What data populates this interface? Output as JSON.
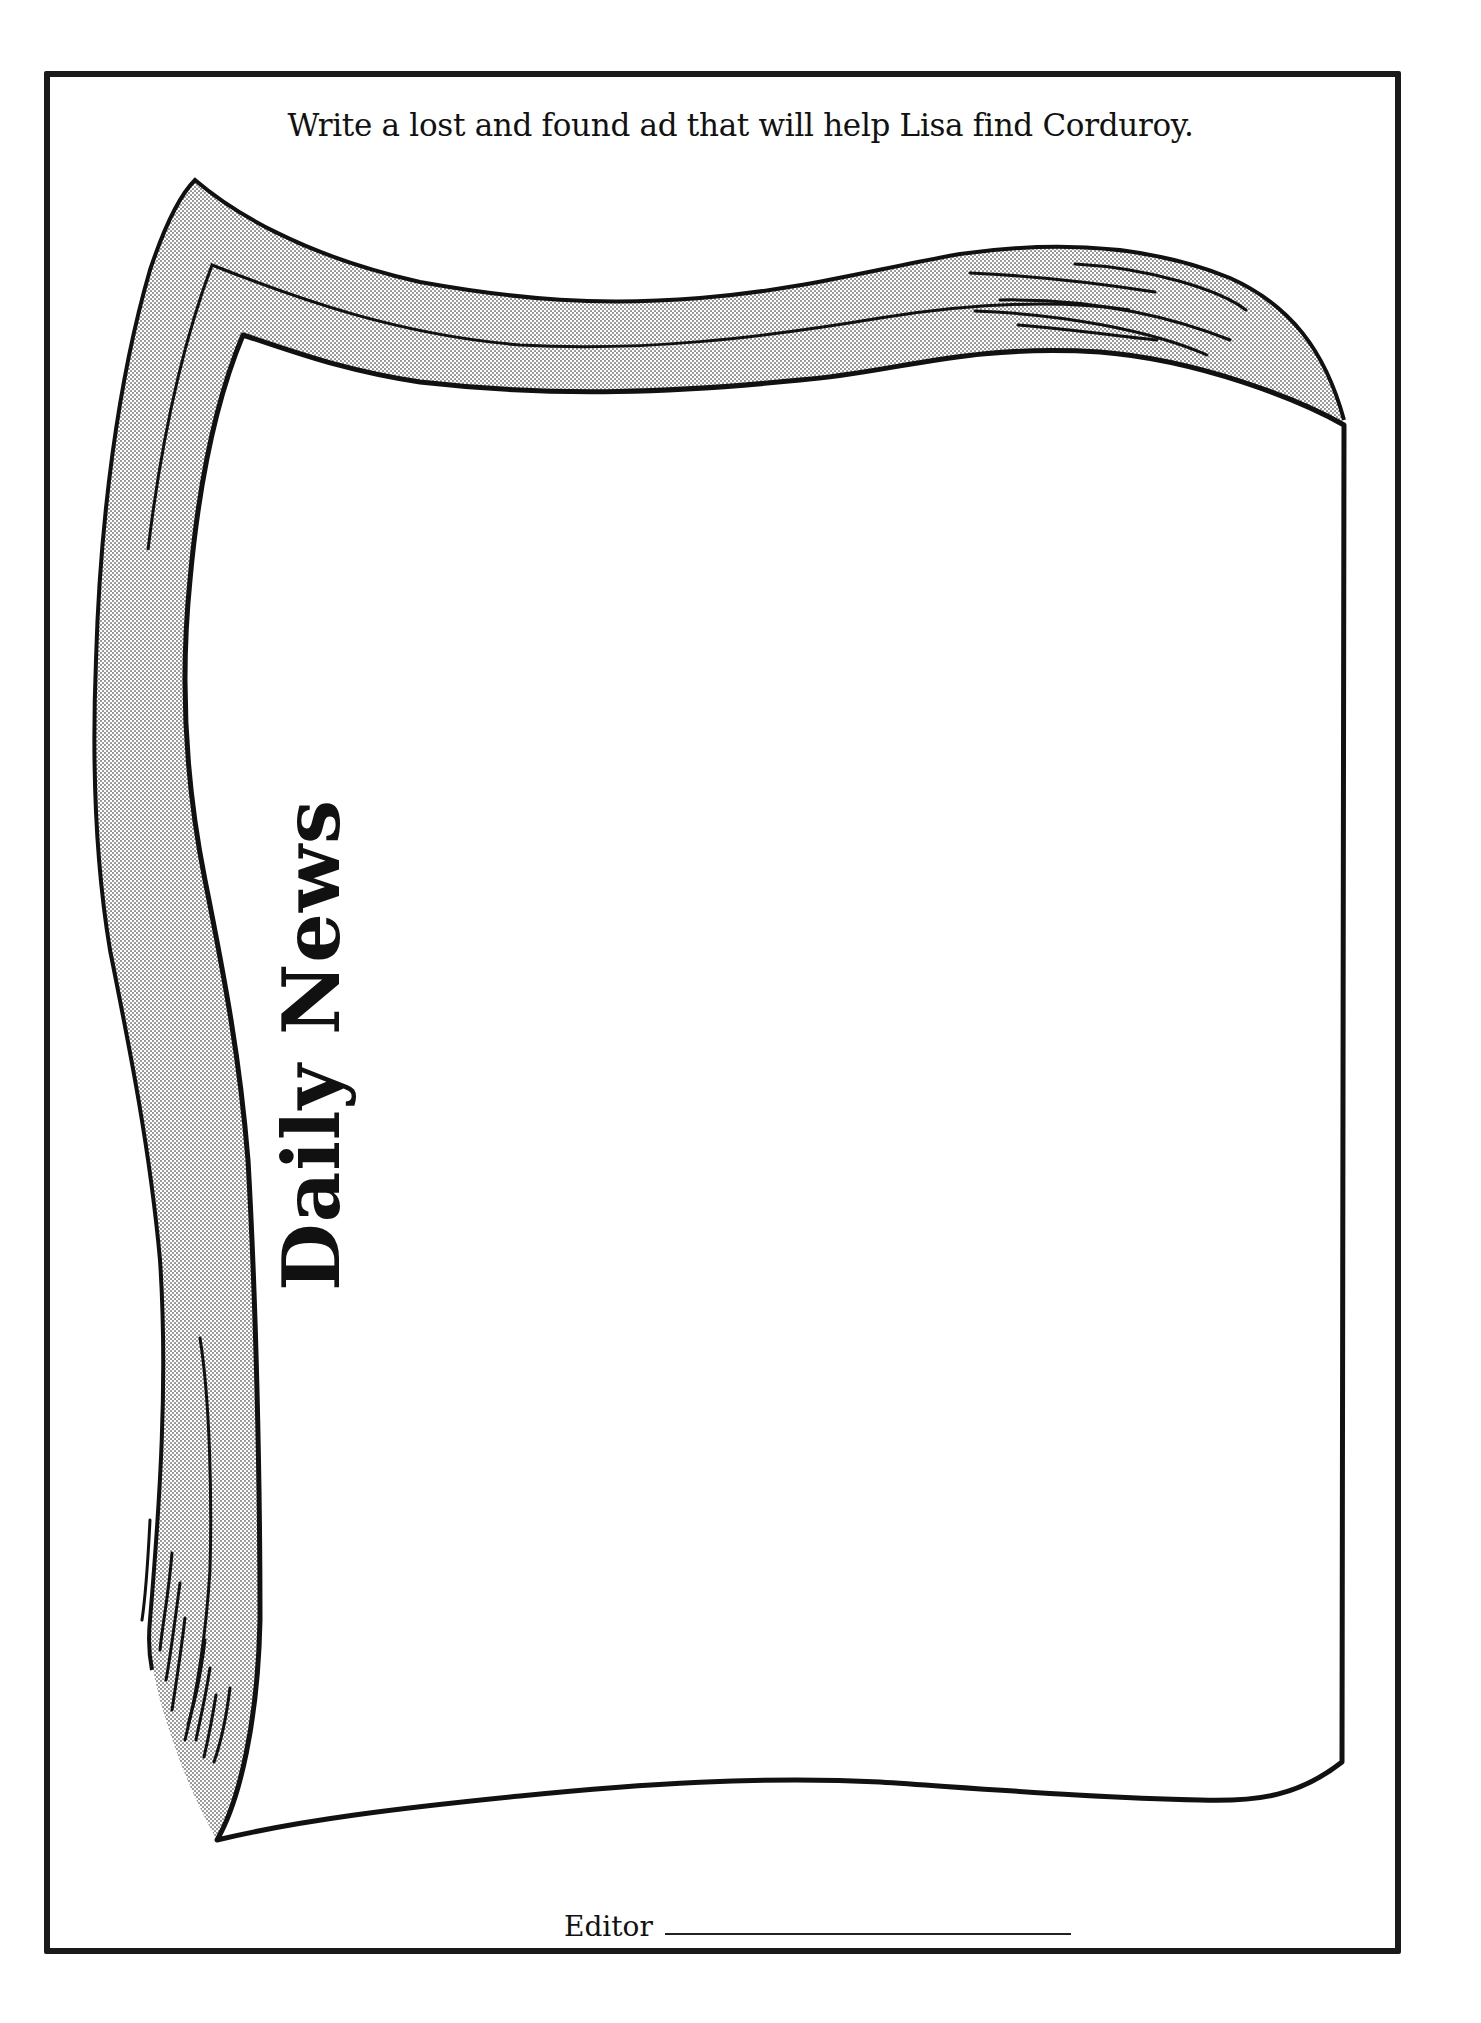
{
  "worksheet": {
    "instruction": "Write a lost and found ad that will help Lisa find Corduroy.",
    "newspaper": {
      "masthead": "Daily News",
      "ad_text": ""
    },
    "editor": {
      "label": "Editor",
      "value": ""
    }
  },
  "colors": {
    "ink": "#111111",
    "frame": "#1a1a1a",
    "curl_shading": "#d6d6d6",
    "paper": "#ffffff"
  }
}
